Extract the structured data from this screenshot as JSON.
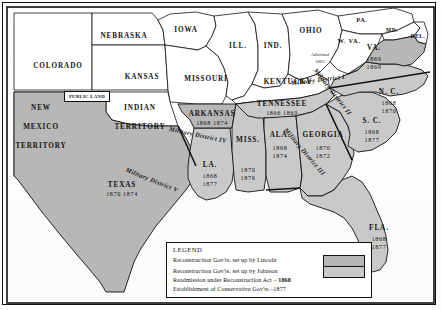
{
  "map": {
    "title": "Reconstruction of the South",
    "colors": {
      "reconstruction_lincoln": "#b7b7b7",
      "reconstruction_johnson": "#c9c9c9",
      "union_states": "#ffffff",
      "border": "#111111",
      "background": "#ffffff"
    },
    "non_reconstruction_states": [
      {
        "name": "COLORADO",
        "x": 58,
        "y": 62,
        "size": "n"
      },
      {
        "name": "NEBRASKA",
        "x": 124,
        "y": 32,
        "size": "n"
      },
      {
        "name": "KANSAS",
        "x": 142,
        "y": 73,
        "size": "n"
      },
      {
        "name": "IOWA",
        "x": 186,
        "y": 26,
        "size": "n"
      },
      {
        "name": "MISSOURI",
        "x": 206,
        "y": 75,
        "size": "n"
      },
      {
        "name": "ILL.",
        "x": 238,
        "y": 42,
        "size": "n"
      },
      {
        "name": "IND.",
        "x": 273,
        "y": 42,
        "size": "n"
      },
      {
        "name": "OHIO",
        "x": 311,
        "y": 27,
        "size": "n"
      },
      {
        "name": "KENTUCKY",
        "x": 288,
        "y": 78,
        "size": "n"
      },
      {
        "name": "PA.",
        "x": 362,
        "y": 16,
        "size": "sm"
      },
      {
        "name": "MD.",
        "x": 392,
        "y": 27,
        "size": "xs"
      },
      {
        "name": "DEL.",
        "x": 418,
        "y": 33,
        "size": "xs"
      },
      {
        "name": "W. VA.",
        "x": 349,
        "y": 37,
        "size": "sm"
      }
    ],
    "territories": [
      {
        "name_lines": [
          "NEW",
          "MEXICO",
          "TERRITORY"
        ],
        "x": 41,
        "y": 104
      },
      {
        "name_lines": [
          "INDIAN",
          "TERRITORY"
        ],
        "x": 140,
        "y": 104
      }
    ],
    "public_land_label": "PUBLIC LAND",
    "west_virginia_note": {
      "line1": "Admitted",
      "line2": "1863"
    },
    "reconstruction_states": [
      {
        "name": "ARKANSAS",
        "readmission": "1868",
        "conservative": "1874",
        "x": 212,
        "y": 110,
        "layout": "row"
      },
      {
        "name": "TENNESSEE",
        "readmission": "1866",
        "conservative": "1869",
        "x": 282,
        "y": 100,
        "layout": "row"
      },
      {
        "name": "MISS.",
        "readmission": "1870",
        "conservative": "1876",
        "x": 248,
        "y": 136,
        "layout": "stack",
        "dates_x": 248,
        "dates_y": 166
      },
      {
        "name": "ALA.",
        "readmission": "1868",
        "conservative": "1874",
        "x": 280,
        "y": 131,
        "layout": "stack",
        "dates_x": 280,
        "dates_y": 144
      },
      {
        "name": "GEORGIA",
        "readmission": "1870",
        "conservative": "1872",
        "x": 323,
        "y": 131,
        "layout": "stack",
        "dates_x": 323,
        "dates_y": 144
      },
      {
        "name": "LA.",
        "readmission": "1868",
        "conservative": "1877",
        "x": 210,
        "y": 161,
        "layout": "stack",
        "dates_x": 210,
        "dates_y": 172
      },
      {
        "name": "TEXAS",
        "readmission": "1870",
        "conservative": "1874",
        "x": 122,
        "y": 181,
        "layout": "row"
      },
      {
        "name": "VA.",
        "readmission": "1869",
        "conservative": "1869",
        "x": 374,
        "y": 44,
        "layout": "stack",
        "dates_x": 374,
        "dates_y": 55
      },
      {
        "name": "N. C.",
        "readmission": "1868",
        "conservative": "1870",
        "x": 389,
        "y": 88,
        "layout": "stack",
        "dates_x": 389,
        "dates_y": 99
      },
      {
        "name": "S. C.",
        "readmission": "1868",
        "conservative": "1877",
        "x": 372,
        "y": 117,
        "layout": "stack",
        "dates_x": 372,
        "dates_y": 128
      },
      {
        "name": "FLA.",
        "readmission": "1868",
        "conservative": "1877",
        "x": 379,
        "y": 224,
        "layout": "stack",
        "dates_x": 379,
        "dates_y": 235
      }
    ],
    "military_districts": [
      {
        "label": "Military District I",
        "x": 318,
        "y": 76,
        "rotate": -7
      },
      {
        "label": "Military District II",
        "x": 333,
        "y": 88,
        "rotate": 52
      },
      {
        "label": "Military District III",
        "x": 305,
        "y": 148,
        "rotate": 50
      },
      {
        "label": "Military District IV",
        "x": 198,
        "y": 131,
        "rotate": 12
      },
      {
        "label": "Military District V",
        "x": 152,
        "y": 176,
        "rotate": 22
      }
    ]
  },
  "legend": {
    "title": "LEGEND",
    "lines": [
      {
        "text": "Reconstruction Gov'ts. set up by Lincoln",
        "swatch": "lincoln"
      },
      {
        "text": "Reconstruction Gov'ts. set up by Johnson",
        "swatch": "johnson"
      },
      {
        "text": "Readmission under Reconstruction Act – ",
        "bold_suffix": "1868"
      },
      {
        "text": "Establishment of Conservative Gov'ts.–1877"
      }
    ]
  }
}
